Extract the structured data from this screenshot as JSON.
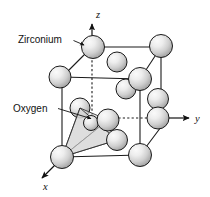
{
  "figure": {
    "background_color": "#ffffff",
    "line_color": "#1a1a1a",
    "sphere_fill_light": "#f2f2f2",
    "sphere_fill_mid": "#c9c9c9",
    "sphere_fill_dark": "#9a9a9a",
    "tetra_fill": "#d9d9d9"
  },
  "annotations": [
    {
      "id": "zirconium",
      "label": "Zirconium",
      "text_x": 18,
      "text_y": 43,
      "leader": "M 73.5,40.5 L 84.5,45.5",
      "arrow_x": 86.5,
      "arrow_y": 46.5
    },
    {
      "id": "oxygen",
      "label": "Oxygen",
      "text_x": 13,
      "text_y": 112,
      "leader": "M 58,108.5 L 92,119",
      "arrow_x": 94.5,
      "arrow_y": 119.8
    }
  ],
  "axes": [
    {
      "id": "z",
      "label": "z",
      "label_x": 96,
      "label_y": 18,
      "line": "M 92,54 L 92,26",
      "tip_x": 92,
      "tip_y": 21,
      "direction": "up"
    },
    {
      "id": "y",
      "label": "y",
      "label_x": 196,
      "label_y": 122,
      "line": "M 168,118 L 186,118",
      "tip_x": 192,
      "tip_y": 118,
      "direction": "right"
    },
    {
      "id": "x",
      "label": "x",
      "label_x": 44,
      "label_y": 188,
      "line": "M 56,164 L 43,177",
      "tip_x": 39,
      "tip_y": 181,
      "direction": "down-left"
    }
  ],
  "cube": {
    "front_face": "M 62,157 L 62,77 L 92,47 L 92,118 Z",
    "edges_solid": [
      "M 62,77 L 92,47",
      "M 92,47 L 161,47",
      "M 161,47 L 161,127",
      "M 161,127 L 140,155",
      "M 140,155 L 62,157",
      "M 62,157 L 62,77",
      "M 62,77 L 140,79",
      "M 140,79 L 161,47",
      "M 140,79 L 140,155"
    ],
    "edges_dashed": [
      "M 92,47 L 92,118",
      "M 92,118 L 161,118"
    ]
  },
  "atoms": [
    {
      "id": "zr-top-front-left",
      "element": "Zirconium",
      "cx": 93,
      "cy": 47,
      "r": 11.5,
      "layer": 3
    },
    {
      "id": "zr-top-back-right",
      "element": "Zirconium",
      "cx": 161,
      "cy": 46,
      "r": 11.5,
      "layer": 3
    },
    {
      "id": "zr-top-face-center",
      "element": "Zirconium",
      "cx": 117,
      "cy": 62,
      "r": 10.0,
      "layer": 2
    },
    {
      "id": "zr-left-top",
      "element": "Zirconium",
      "cx": 60,
      "cy": 77,
      "r": 11.0,
      "layer": 2
    },
    {
      "id": "zr-mid-back-right",
      "element": "Zirconium",
      "cx": 140,
      "cy": 79,
      "r": 11.5,
      "layer": 2
    },
    {
      "id": "zr-face-right-upper",
      "element": "Zirconium",
      "cx": 126,
      "cy": 89,
      "r": 10.0,
      "layer": 2
    },
    {
      "id": "zr-right-mid",
      "element": "Zirconium",
      "cx": 158,
      "cy": 99,
      "r": 10.5,
      "layer": 2
    },
    {
      "id": "zr-right-y",
      "element": "Zirconium",
      "cx": 158,
      "cy": 118,
      "r": 11.0,
      "layer": 3
    },
    {
      "id": "o-upper-left",
      "element": "Oxygen",
      "cx": 80,
      "cy": 108,
      "r": 10.0,
      "layer": 1
    },
    {
      "id": "o-center",
      "element": "Oxygen",
      "cx": 108,
      "cy": 120,
      "r": 11.0,
      "layer": 2
    },
    {
      "id": "o-lower-right",
      "element": "Oxygen",
      "cx": 117,
      "cy": 140,
      "r": 10.5,
      "layer": 2
    },
    {
      "id": "o-inner-small",
      "element": "Oxygen",
      "cx": 91,
      "cy": 123,
      "r": 7.5,
      "layer": 3
    },
    {
      "id": "zr-bottom-front-left",
      "element": "Zirconium",
      "cx": 62,
      "cy": 157,
      "r": 11.5,
      "layer": 4
    },
    {
      "id": "zr-bottom-front-right",
      "element": "Zirconium",
      "cx": 140,
      "cy": 155,
      "r": 11.5,
      "layer": 4
    }
  ],
  "tetrahedron": {
    "apex": {
      "x": 62,
      "y": 157
    },
    "vertices": [
      {
        "x": 80,
        "y": 108
      },
      {
        "x": 108,
        "y": 120
      },
      {
        "x": 117,
        "y": 140
      }
    ],
    "faces": [
      "M 62,157 L 80,108 L 108,120 Z",
      "M 62,157 L 108,120 L 117,140 Z",
      "M 62,157 L 80,108 L 117,140 Z"
    ]
  }
}
